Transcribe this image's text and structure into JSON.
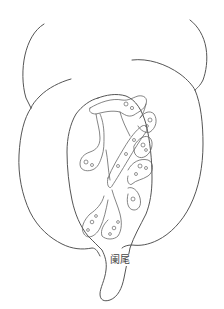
{
  "diagram": {
    "labels": [
      {
        "id": "appendix",
        "text": "阑尾"
      }
    ],
    "line_color": "#555555",
    "background": "#ffffff"
  }
}
